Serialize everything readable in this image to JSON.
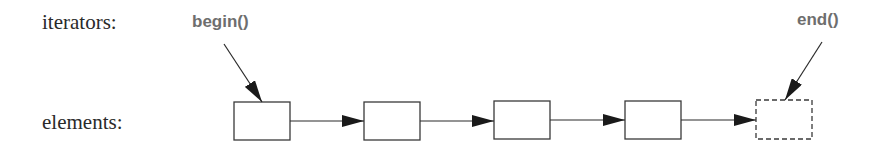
{
  "diagram": {
    "row_labels": {
      "iterators": "iterators:",
      "elements": "elements:"
    },
    "iterators": [
      {
        "label": "begin()",
        "points_to": 0
      },
      {
        "label": "end()",
        "points_to": 4
      }
    ],
    "elements": [
      {
        "index": 0,
        "style": "solid"
      },
      {
        "index": 1,
        "style": "solid"
      },
      {
        "index": 2,
        "style": "solid"
      },
      {
        "index": 3,
        "style": "solid"
      },
      {
        "index": 4,
        "style": "dashed",
        "meaning": "past-the-end position"
      }
    ],
    "links": [
      {
        "from": 0,
        "to": 1
      },
      {
        "from": 1,
        "to": 2
      },
      {
        "from": 2,
        "to": 3
      },
      {
        "from": 3,
        "to": 4
      }
    ],
    "colors": {
      "line": "#2a2a2a",
      "iterator_text": "#6e6e6e",
      "label_text": "#2a2a2a"
    }
  }
}
